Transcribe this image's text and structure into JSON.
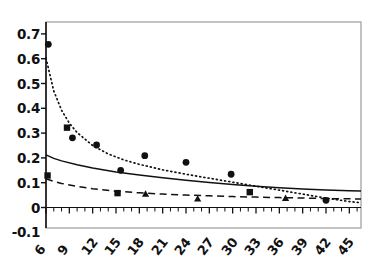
{
  "chart_data": {
    "type": "scatter",
    "title": "",
    "xlabel": "",
    "ylabel": "",
    "xlim": [
      6,
      46.5
    ],
    "ylim": [
      -0.1,
      0.7
    ],
    "grid": false,
    "legend": "none",
    "y_ticks": [
      0.7,
      0.6,
      0.5,
      0.4,
      0.3,
      0.2,
      0.1,
      0,
      -0.1
    ],
    "y_tick_labels": [
      "0.7",
      "0.6",
      "0.5",
      "0.4",
      "0.3",
      "0.2",
      "0.1",
      "0",
      "-0.1"
    ],
    "x_ticks": [
      6,
      9,
      12,
      15,
      18,
      21,
      24,
      27,
      30,
      33,
      36,
      39,
      42,
      45
    ],
    "x_tick_labels": [
      "6",
      "9",
      "12",
      "15",
      "18",
      "21",
      "24",
      "27",
      "30",
      "33",
      "36",
      "39",
      "42",
      "45"
    ],
    "x_minor_tick_step": 1,
    "series": [
      {
        "name": "circle-markers",
        "marker": "circle",
        "color": "#111111",
        "points": [
          {
            "x": 6.3,
            "y": 0.658
          },
          {
            "x": 9.4,
            "y": 0.281
          },
          {
            "x": 12.5,
            "y": 0.252
          },
          {
            "x": 15.6,
            "y": 0.15
          },
          {
            "x": 18.7,
            "y": 0.209
          },
          {
            "x": 24.0,
            "y": 0.182
          },
          {
            "x": 29.8,
            "y": 0.134
          },
          {
            "x": 42.0,
            "y": 0.029
          }
        ]
      },
      {
        "name": "square-markers",
        "marker": "square",
        "color": "#111111",
        "points": [
          {
            "x": 6.2,
            "y": 0.129
          },
          {
            "x": 8.7,
            "y": 0.322
          },
          {
            "x": 15.2,
            "y": 0.058
          },
          {
            "x": 32.2,
            "y": 0.062
          }
        ]
      },
      {
        "name": "triangle-markers",
        "marker": "triangle",
        "color": "#111111",
        "points": [
          {
            "x": 18.8,
            "y": 0.055
          },
          {
            "x": 25.5,
            "y": 0.035
          },
          {
            "x": 36.8,
            "y": 0.038
          }
        ]
      },
      {
        "name": "dotted-fit-curve",
        "style": "dotted",
        "color": "#111111",
        "curve": [
          {
            "x": 6.0,
            "y": 0.602
          },
          {
            "x": 7.0,
            "y": 0.47
          },
          {
            "x": 8.0,
            "y": 0.392
          },
          {
            "x": 9.0,
            "y": 0.34
          },
          {
            "x": 10.0,
            "y": 0.302
          },
          {
            "x": 12.0,
            "y": 0.25
          },
          {
            "x": 14.0,
            "y": 0.216
          },
          {
            "x": 16.0,
            "y": 0.192
          },
          {
            "x": 18.0,
            "y": 0.174
          },
          {
            "x": 21.0,
            "y": 0.152
          },
          {
            "x": 24.0,
            "y": 0.134
          },
          {
            "x": 27.0,
            "y": 0.118
          },
          {
            "x": 30.0,
            "y": 0.102
          },
          {
            "x": 33.0,
            "y": 0.086
          },
          {
            "x": 36.0,
            "y": 0.07
          },
          {
            "x": 39.0,
            "y": 0.054
          },
          {
            "x": 42.0,
            "y": 0.038
          },
          {
            "x": 45.0,
            "y": 0.024
          },
          {
            "x": 46.5,
            "y": 0.019
          }
        ]
      },
      {
        "name": "solid-fit-curve",
        "style": "solid",
        "color": "#111111",
        "curve": [
          {
            "x": 6.0,
            "y": 0.212
          },
          {
            "x": 7.0,
            "y": 0.198
          },
          {
            "x": 8.0,
            "y": 0.188
          },
          {
            "x": 10.0,
            "y": 0.172
          },
          {
            "x": 12.0,
            "y": 0.159
          },
          {
            "x": 15.0,
            "y": 0.143
          },
          {
            "x": 18.0,
            "y": 0.131
          },
          {
            "x": 21.0,
            "y": 0.12
          },
          {
            "x": 24.0,
            "y": 0.11
          },
          {
            "x": 27.0,
            "y": 0.101
          },
          {
            "x": 30.0,
            "y": 0.093
          },
          {
            "x": 33.0,
            "y": 0.086
          },
          {
            "x": 36.0,
            "y": 0.08
          },
          {
            "x": 39.0,
            "y": 0.075
          },
          {
            "x": 42.0,
            "y": 0.071
          },
          {
            "x": 45.0,
            "y": 0.068
          },
          {
            "x": 46.5,
            "y": 0.067
          }
        ]
      },
      {
        "name": "dashed-fit-curve",
        "style": "dashed",
        "color": "#111111",
        "curve": [
          {
            "x": 6.0,
            "y": 0.116
          },
          {
            "x": 7.0,
            "y": 0.105
          },
          {
            "x": 8.0,
            "y": 0.097
          },
          {
            "x": 10.0,
            "y": 0.085
          },
          {
            "x": 12.0,
            "y": 0.076
          },
          {
            "x": 15.0,
            "y": 0.066
          },
          {
            "x": 18.0,
            "y": 0.059
          },
          {
            "x": 21.0,
            "y": 0.054
          },
          {
            "x": 24.0,
            "y": 0.05
          },
          {
            "x": 27.0,
            "y": 0.047
          },
          {
            "x": 30.0,
            "y": 0.044
          },
          {
            "x": 33.0,
            "y": 0.042
          },
          {
            "x": 36.0,
            "y": 0.04
          },
          {
            "x": 39.0,
            "y": 0.038
          },
          {
            "x": 42.0,
            "y": 0.036
          },
          {
            "x": 45.0,
            "y": 0.035
          },
          {
            "x": 46.5,
            "y": 0.034
          }
        ]
      }
    ]
  },
  "axes": {
    "frame_color": "#9b9b9b",
    "axis_color": "#111111"
  }
}
